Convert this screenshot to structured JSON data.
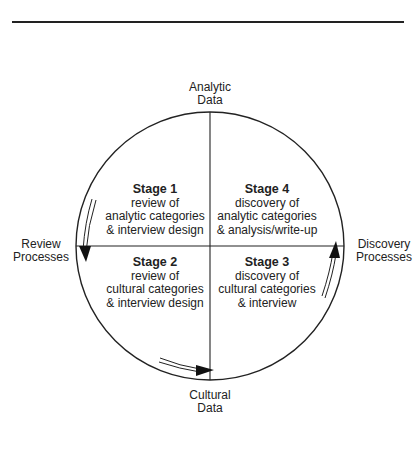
{
  "diagram": {
    "axes": {
      "top": [
        "Analytic",
        "Data"
      ],
      "bottom": [
        "Cultural",
        "Data"
      ],
      "left": [
        "Review",
        "Processes"
      ],
      "right": [
        "Discovery",
        "Processes"
      ]
    },
    "stages": [
      {
        "id": "stage1",
        "title": "Stage 1",
        "lines": [
          "review of",
          "analytic categories",
          "& interview design"
        ],
        "quadrant": "top-left"
      },
      {
        "id": "stage4",
        "title": "Stage 4",
        "lines": [
          "discovery of",
          "analytic categories",
          "& analysis/write-up"
        ],
        "quadrant": "top-right"
      },
      {
        "id": "stage2",
        "title": "Stage 2",
        "lines": [
          "review of",
          "cultural categories",
          "& interview design"
        ],
        "quadrant": "bottom-left"
      },
      {
        "id": "stage3",
        "title": "Stage 3",
        "lines": [
          "discovery of",
          "cultural categories",
          "& interview"
        ],
        "quadrant": "bottom-right"
      }
    ],
    "arrows": [
      {
        "from": "stage1",
        "to": "stage2",
        "direction": "down"
      },
      {
        "from": "stage2",
        "to": "stage3",
        "direction": "right"
      },
      {
        "from": "stage3",
        "to": "stage4",
        "direction": "up"
      }
    ],
    "colors": {
      "line": "#222222",
      "background": "#ffffff"
    }
  }
}
